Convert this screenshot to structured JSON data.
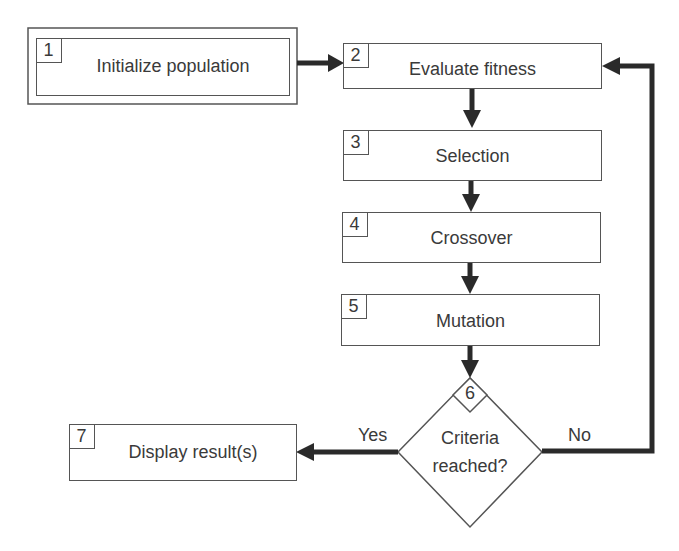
{
  "diagram": {
    "type": "flowchart",
    "steps": [
      {
        "id": "1",
        "label": "Initialize population",
        "shape": "double-rect"
      },
      {
        "id": "2",
        "label": "Evaluate fitness",
        "shape": "rect"
      },
      {
        "id": "3",
        "label": "Selection",
        "shape": "rect"
      },
      {
        "id": "4",
        "label": "Crossover",
        "shape": "rect"
      },
      {
        "id": "5",
        "label": "Mutation",
        "shape": "rect"
      },
      {
        "id": "6",
        "label_line1": "Criteria",
        "label_line2": "reached?",
        "shape": "diamond"
      },
      {
        "id": "7",
        "label": "Display result(s)",
        "shape": "rect"
      }
    ],
    "edges": [
      {
        "from": "1",
        "to": "2",
        "label": ""
      },
      {
        "from": "2",
        "to": "3",
        "label": ""
      },
      {
        "from": "3",
        "to": "4",
        "label": ""
      },
      {
        "from": "4",
        "to": "5",
        "label": ""
      },
      {
        "from": "5",
        "to": "6",
        "label": ""
      },
      {
        "from": "6",
        "to": "7",
        "label": "Yes"
      },
      {
        "from": "6",
        "to": "2",
        "label": "No"
      }
    ],
    "colors": {
      "stroke": "#555555",
      "arrow": "#2a2a2a",
      "text": "#3a3a3a",
      "background": "#ffffff"
    }
  }
}
